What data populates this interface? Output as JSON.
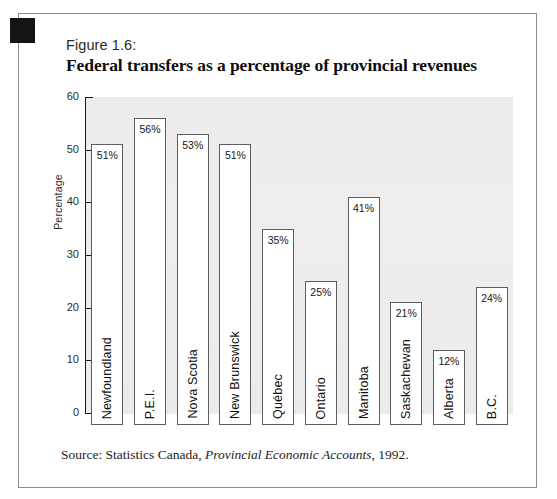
{
  "figure": {
    "number_label": "Figure 1.6:",
    "title": "Federal transfers as a percentage of provincial revenues",
    "source_prefix": "Source: Statistics Canada,",
    "source_italic": "Provincial Economic Accounts",
    "source_suffix": ", 1992."
  },
  "colors": {
    "frame_border": "#8d8d8d",
    "plot_background": "#ececec",
    "bar_fill": "#ffffff",
    "bar_border": "#5d5d5d",
    "axis": "#17181a",
    "marker": "#141414"
  },
  "chart_data": {
    "type": "bar",
    "title": "Federal transfers as a percentage of provincial revenues",
    "xlabel": "",
    "ylabel": "Percentage",
    "ylim": [
      0,
      60
    ],
    "yticks": [
      0,
      10,
      20,
      30,
      40,
      50,
      60
    ],
    "grid": false,
    "legend": "none",
    "value_suffix": "%",
    "categories": [
      "Newfoundland",
      "P.E.I.",
      "Nova Scotia",
      "New Brunswick",
      "Québec",
      "Ontario",
      "Manitoba",
      "Saskachewan",
      "Alberta",
      "B.C."
    ],
    "values": [
      51,
      56,
      53,
      51,
      35,
      25,
      41,
      21,
      12,
      24
    ],
    "value_labels": [
      "51%",
      "56%",
      "53%",
      "51%",
      "35%",
      "25%",
      "41%",
      "21%",
      "12%",
      "24%"
    ]
  }
}
